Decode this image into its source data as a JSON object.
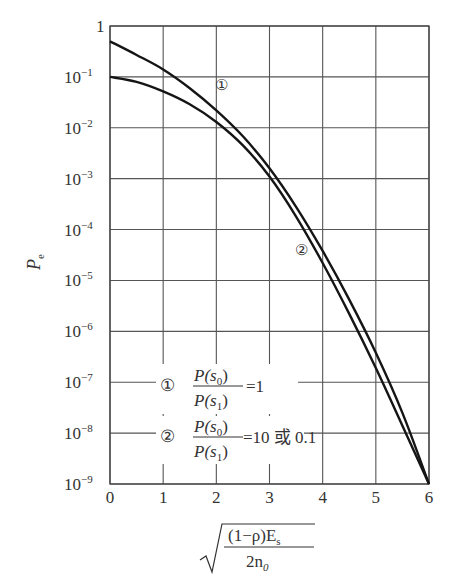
{
  "chart_data": {
    "type": "line",
    "title": "",
    "ylabel": "P_e",
    "ylabel_main": "P",
    "ylabel_sub": "e",
    "xlabel": "sqrt((1-ρ)E_s / (2n_0))",
    "xlabel_numerator": "(1−ρ)E",
    "xlabel_numerator_sub": "s",
    "xlabel_denominator": "2n",
    "xlabel_denominator_sub": "0",
    "yscale": "log",
    "xlim": [
      0,
      6
    ],
    "ylim": [
      1e-09,
      1
    ],
    "grid": true,
    "x_ticks": [
      "0",
      "1",
      "2",
      "3",
      "4",
      "5",
      "6"
    ],
    "y_ticks": [
      {
        "base": "1",
        "exp": ""
      },
      {
        "base": "10",
        "exp": "−1"
      },
      {
        "base": "10",
        "exp": "−2"
      },
      {
        "base": "10",
        "exp": "−3"
      },
      {
        "base": "10",
        "exp": "−4"
      },
      {
        "base": "10",
        "exp": "−5"
      },
      {
        "base": "10",
        "exp": "−6"
      },
      {
        "base": "10",
        "exp": "−7"
      },
      {
        "base": "10",
        "exp": "−8"
      },
      {
        "base": "10",
        "exp": "−9"
      }
    ],
    "series": [
      {
        "name": "① P(s0)/P(s1)=1",
        "marker_label": "①",
        "x": [
          0,
          0.5,
          1,
          1.5,
          2,
          2.5,
          3,
          3.5,
          4,
          4.5,
          5,
          5.5,
          6
        ],
        "y": [
          0.5,
          0.27,
          0.14,
          0.06,
          0.022,
          0.0068,
          0.0016,
          0.00028,
          3.8e-05,
          4.2e-06,
          3.8e-07,
          2.5e-08,
          1e-09
        ]
      },
      {
        "name": "② P(s0)/P(s1)=10 或 0.1",
        "marker_label": "②",
        "x": [
          0,
          0.5,
          1,
          1.5,
          2,
          2.5,
          3,
          3.5,
          4,
          4.5,
          5,
          5.5,
          6
        ],
        "y": [
          0.1,
          0.08,
          0.052,
          0.029,
          0.013,
          0.0045,
          0.0011,
          0.00018,
          2.2e-05,
          2.2e-06,
          1.9e-07,
          1.4e-08,
          1e-09
        ]
      }
    ],
    "annotations": [
      {
        "text": "①",
        "x": 2.1,
        "y": 0.07
      },
      {
        "text": "②",
        "x": 3.6,
        "y": 4e-05
      }
    ],
    "legend": [
      {
        "marker": "①",
        "num": "P(s",
        "num_sub": "0",
        "num_end": ")",
        "den": "P(s",
        "den_sub": "1",
        "den_end": ")",
        "value": "=1"
      },
      {
        "marker": "②",
        "num": "P(s",
        "num_sub": "0",
        "num_end": ")",
        "den": "P(s",
        "den_sub": "1",
        "den_end": ")",
        "value": "=10 或 0.1"
      }
    ],
    "colors": {
      "line": "#151515",
      "grid": "#555555"
    }
  }
}
